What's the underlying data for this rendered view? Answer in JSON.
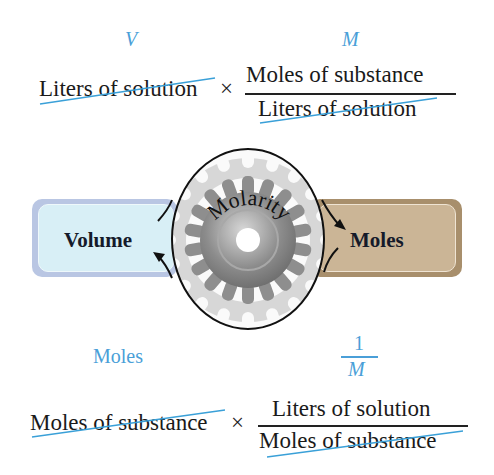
{
  "top_conversion": {
    "given_label": "V",
    "factor_label": "M",
    "given_quantity": "Liters of solution",
    "operator": "×",
    "factor_numerator": "Moles of substance",
    "factor_denominator": "Liters of solution"
  },
  "center_diagram": {
    "left_box": "Volume",
    "right_box": "Moles",
    "gear_label": "Molarity"
  },
  "bottom_conversion": {
    "given_label": "Moles",
    "factor_label_numerator": "1",
    "factor_label_denominator": "M",
    "given_quantity": "Moles of substance",
    "operator": "×",
    "factor_numerator": "Liters of solution",
    "factor_denominator": "Moles of substance"
  },
  "colors": {
    "label_blue": "#4a9fd8",
    "cancel_line": "#3aa0d8",
    "volume_box": "#d6eef5",
    "moles_box": "#c9b393",
    "gear": "#8a8a8a"
  }
}
